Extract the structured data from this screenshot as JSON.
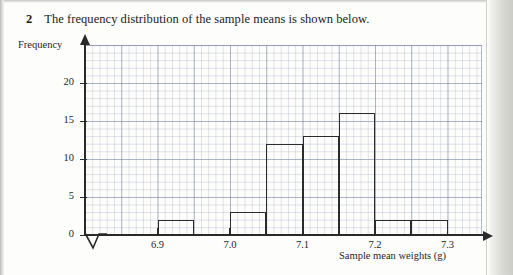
{
  "question": {
    "number": "2",
    "text": "The frequency distribution of the sample means is shown below."
  },
  "chart_data": {
    "type": "bar",
    "title": "",
    "subtitle": "",
    "xlabel": "Sample mean weights (g)",
    "ylabel": "Frequency",
    "grid": true,
    "legend": null,
    "xlim": [
      6.875,
      7.345
    ],
    "ylim": [
      0,
      25
    ],
    "xticks": [
      "6.9",
      "7.0",
      "7.1",
      "7.2",
      "7.3"
    ],
    "xtick_values": [
      6.9,
      7.0,
      7.1,
      7.2,
      7.3
    ],
    "yticks": [
      "0",
      "5",
      "10",
      "15",
      "20"
    ],
    "ytick_values": [
      0,
      5,
      10,
      15,
      20
    ],
    "axis_break_x": true,
    "bar_width": 0.05,
    "bins": [
      {
        "start": 6.9,
        "end": 6.95,
        "value": 2
      },
      {
        "start": 7.0,
        "end": 7.05,
        "value": 3
      },
      {
        "start": 7.05,
        "end": 7.1,
        "value": 12
      },
      {
        "start": 7.1,
        "end": 7.15,
        "value": 13
      },
      {
        "start": 7.15,
        "end": 7.2,
        "value": 16
      },
      {
        "start": 7.2,
        "end": 7.25,
        "value": 2
      },
      {
        "start": 7.25,
        "end": 7.3,
        "value": 2
      }
    ],
    "categories": [
      "6.90-6.95",
      "7.00-7.05",
      "7.05-7.10",
      "7.10-7.15",
      "7.15-7.20",
      "7.20-7.25",
      "7.25-7.30"
    ],
    "values": [
      2,
      3,
      12,
      13,
      16,
      2,
      2
    ],
    "colors": {
      "bar_outline": "#2b2b2b",
      "axis": "#2a2a2a",
      "grid_major": "#7882a0",
      "grid_minor": "#8c96b2",
      "text": "#1f1f1f"
    }
  }
}
